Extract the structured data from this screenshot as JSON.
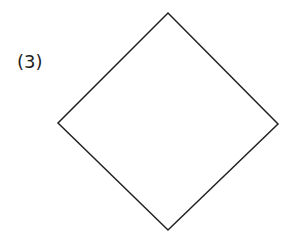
{
  "figure": {
    "label": "(3)",
    "label_position": {
      "x": 17,
      "y": 68
    },
    "background_color": "#ffffff",
    "stroke_color": "#222222",
    "stroke_width": 1.5,
    "label_color": "#1d1d1d",
    "label_font_size": 18,
    "shape": {
      "name": "diamond",
      "type": "quadrilateral",
      "fill": "none",
      "closed": true,
      "vertices": [
        {
          "name": "top",
          "x": 168,
          "y": 13
        },
        {
          "name": "right",
          "x": 278,
          "y": 124
        },
        {
          "name": "bottom",
          "x": 168,
          "y": 230
        },
        {
          "name": "left",
          "x": 58,
          "y": 123
        }
      ],
      "points": "168,13 278,124 168,230 58,123"
    }
  },
  "canvas": {
    "width": 299,
    "height": 244
  }
}
